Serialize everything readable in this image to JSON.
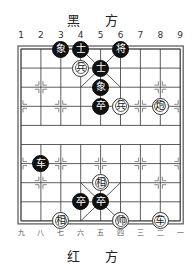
{
  "header": {
    "black_side_label": "黑 方",
    "red_side_label": "红 方"
  },
  "board": {
    "columns_top": [
      "1",
      "2",
      "3",
      "4",
      "5",
      "6",
      "7",
      "8",
      "9"
    ],
    "columns_bottom": [
      "九",
      "八",
      "七",
      "六",
      "五",
      "四",
      "三",
      "二",
      "一"
    ],
    "river_text": "",
    "grid": {
      "left": 21,
      "top": 49,
      "col_spacing": 19.9,
      "row_spacing": 19.1,
      "cols": 9,
      "rows": 10
    },
    "line_color": "#333333"
  },
  "pieces": [
    {
      "side": "black",
      "char": "象",
      "col": 3,
      "row": 0
    },
    {
      "side": "black",
      "char": "士",
      "col": 4,
      "row": 0
    },
    {
      "side": "black",
      "char": "将",
      "col": 6,
      "row": 0
    },
    {
      "side": "black",
      "char": "士",
      "col": 5,
      "row": 1
    },
    {
      "side": "black",
      "char": "象",
      "col": 5,
      "row": 2
    },
    {
      "side": "black",
      "char": "卒",
      "col": 5,
      "row": 3
    },
    {
      "side": "black",
      "char": "车",
      "col": 2,
      "row": 6
    },
    {
      "side": "black",
      "char": "卒",
      "col": 4,
      "row": 8
    },
    {
      "side": "black",
      "char": "卒",
      "col": 5,
      "row": 8
    },
    {
      "side": "red",
      "char": "兵",
      "col": 4,
      "row": 1
    },
    {
      "side": "red",
      "char": "兵",
      "col": 6,
      "row": 3
    },
    {
      "side": "red",
      "char": "炮",
      "col": 8,
      "row": 3
    },
    {
      "side": "red",
      "char": "相",
      "col": 5,
      "row": 7
    },
    {
      "side": "red",
      "char": "相",
      "col": 3,
      "row": 9
    },
    {
      "side": "red",
      "char": "帅",
      "col": 6,
      "row": 9
    },
    {
      "side": "red",
      "char": "车",
      "col": 8,
      "row": 9
    }
  ]
}
